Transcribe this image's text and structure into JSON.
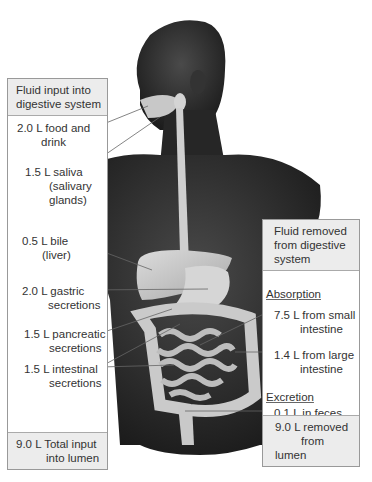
{
  "left_panel": {
    "header_line1": "Fluid input into",
    "header_line2": "digestive system",
    "items": [
      {
        "amount": "2.0 L food and",
        "cont": "drink"
      },
      {
        "amount": "1.5 L saliva",
        "cont1": "(salivary",
        "cont2": "glands)"
      },
      {
        "amount": "0.5 L bile",
        "cont": "(liver)"
      },
      {
        "amount": "2.0 L gastric",
        "cont": "secretions"
      },
      {
        "amount": "1.5 L pancreatic",
        "cont": "secretions"
      },
      {
        "amount": "1.5 L intestinal",
        "cont": "secretions"
      }
    ],
    "footer_line1": "9.0 L Total input",
    "footer_line2": "into lumen"
  },
  "right_panel": {
    "header_line1": "Fluid removed",
    "header_line2": "from digestive",
    "header_line3": "system",
    "absorption_label": "Absorption",
    "items": [
      {
        "amount": "7.5 L from small",
        "cont": "intestine"
      },
      {
        "amount": "1.4 L from large",
        "cont": "intestine"
      }
    ],
    "excretion_label": "Excretion",
    "excretion_item": "0.1 L in feces",
    "footer_line1": "9.0 L removed",
    "footer_line2": "from lumen"
  },
  "colors": {
    "skin": "#2b2b2b",
    "organ": "#c9c9c9",
    "panel_header": "#ececec",
    "border": "#999999",
    "text": "#333333"
  }
}
